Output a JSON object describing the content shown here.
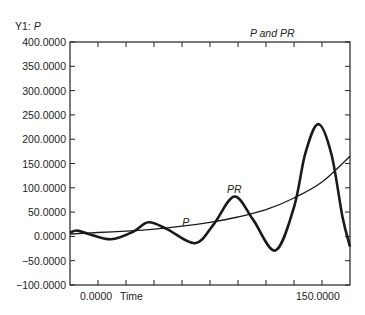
{
  "chart_data": {
    "type": "line",
    "title": "P and PR",
    "ylabel_prefix": "Y1: ",
    "ylabel": "P",
    "xlabel": "Time",
    "xlim": [
      0,
      150
    ],
    "ylim": [
      -100,
      400
    ],
    "x_tick_labels": [
      "0.0000",
      "150.0000"
    ],
    "x_tick_count": 11,
    "y_ticks": [
      400,
      350,
      300,
      250,
      200,
      150,
      100,
      50,
      0,
      -50,
      -100
    ],
    "y_tick_labels": [
      "400.0000",
      "350.0000",
      "300.0000",
      "250.0000",
      "200.0000",
      "150.0000",
      "100.0000",
      "50.0000",
      "0.0000",
      "-50.0000",
      "-100.0000"
    ],
    "grid": false,
    "legend": "none",
    "series": [
      {
        "name": "P",
        "label": "P",
        "stroke_width": 1.3,
        "label_pos": [
          62,
          22
        ],
        "x": [
          0,
          15,
          30,
          45,
          60,
          75,
          90,
          105,
          120,
          135,
          150
        ],
        "values": [
          5,
          8,
          11,
          15,
          21,
          29,
          40,
          55,
          79,
          112,
          165
        ]
      },
      {
        "name": "PR",
        "label": "PR",
        "stroke_width": 2.6,
        "label_pos": [
          88,
          90
        ],
        "x": [
          0,
          4,
          10,
          22,
          34,
          42,
          52,
          67,
          77,
          88,
          98,
          110,
          120,
          126,
          133,
          140,
          146,
          150
        ],
        "values": [
          8,
          12,
          5,
          -6,
          10,
          29,
          15,
          -14,
          25,
          82,
          35,
          -29,
          60,
          170,
          231,
          170,
          40,
          -21
        ]
      }
    ]
  }
}
